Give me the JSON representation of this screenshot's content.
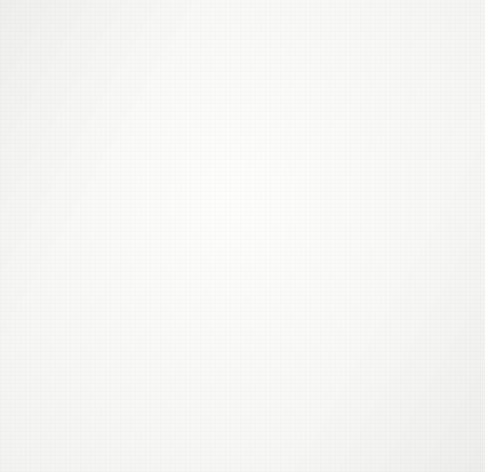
{
  "artwork": {
    "title": "Spiky burr plant study",
    "medium": "pen and ink line drawing",
    "signature": "K N.",
    "signature_position": "lower-left",
    "ink_color": "#3b3b3b",
    "paper_color": "#f8f8f6",
    "canvas": {
      "width": 485,
      "height": 472
    }
  },
  "scene": {
    "subject": "branching plant bearing three clusters of spiny spherical burrs",
    "description": "A central forked stem rises from the bottom edge; the taller right fork carries a terminal cluster of spiny globes at the top, and two lateral branches carry lower clusters at left and right.",
    "cluster_count": 3,
    "burr_count_total": 21,
    "pod_count_total": 6
  },
  "elements": {
    "stems": [
      {
        "name": "main-stem-left",
        "path": "M214,332 C212,372 210,398 211,444"
      },
      {
        "name": "main-stem-right",
        "path": "M252,330 C251,374 250,400 250,448"
      },
      {
        "name": "trunk-upper-left",
        "path": "M214,334 C213,290 214,248 216,208 C217,192 216,180 214,168"
      },
      {
        "name": "trunk-upper-right",
        "path": "M252,330 C253,286 254,244 256,206 C258,190 259,178 262,168"
      },
      {
        "name": "branch-left-lateral",
        "path": "M213,338 C196,346 172,350 146,350"
      },
      {
        "name": "branch-right-lateral",
        "path": "M252,340 C272,350 296,356 318,358"
      },
      {
        "name": "branch-left-upper",
        "path": "M212,330 C198,318 180,308 162,302"
      },
      {
        "name": "branch-right-upper",
        "path": "M253,330 C268,320 284,312 300,306"
      }
    ],
    "clusters": [
      {
        "name": "top-cluster",
        "center": [
          238,
          110
        ],
        "burrs": [
          [
            185,
            68,
            23
          ],
          [
            219,
            58,
            19
          ],
          [
            257,
            48,
            23
          ],
          [
            298,
            74,
            24
          ],
          [
            163,
            104,
            21
          ],
          [
            190,
            140,
            24
          ],
          [
            307,
            118,
            22
          ],
          [
            310,
            155,
            23
          ],
          [
            238,
            118,
            23
          ],
          [
            268,
            82,
            22
          ]
        ],
        "pod": {
          "cx": 238,
          "cy": 112,
          "rx": 56,
          "ry": 52
        }
      },
      {
        "name": "left-cluster",
        "center": [
          152,
          300
        ],
        "burrs": [
          [
            122,
            258,
            19
          ],
          [
            162,
            252,
            20
          ],
          [
            114,
            292,
            20
          ],
          [
            190,
            285,
            18
          ],
          [
            160,
            300,
            20
          ]
        ],
        "pods": [
          {
            "name": "left-upper-pod",
            "cx": 168,
            "cy": 296,
            "rx": 42,
            "ry": 34
          },
          {
            "name": "left-lower-pod",
            "cx": 142,
            "cy": 342,
            "rx": 44,
            "ry": 30
          }
        ]
      },
      {
        "name": "right-cluster",
        "center": [
          330,
          315
        ],
        "burrs": [
          [
            360,
            298,
            20
          ],
          [
            390,
            316,
            21
          ],
          [
            383,
            352,
            21
          ],
          [
            342,
            336,
            20
          ],
          [
            356,
            372,
            17
          ]
        ],
        "pods": [
          {
            "name": "right-upper-pod",
            "cx": 298,
            "cy": 300,
            "rx": 34,
            "ry": 33
          },
          {
            "name": "right-mid-pod",
            "cx": 330,
            "cy": 330,
            "rx": 40,
            "ry": 28
          },
          {
            "name": "right-lower-pod",
            "cx": 322,
            "cy": 385,
            "rx": 29,
            "ry": 27
          }
        ]
      }
    ],
    "surface_marks": {
      "glyphs": [
        "n",
        "u",
        "o",
        "c",
        "v",
        "r",
        "s",
        "q"
      ],
      "meaning": "small hook and dot strokes indicating bristly pod surface texture"
    }
  }
}
